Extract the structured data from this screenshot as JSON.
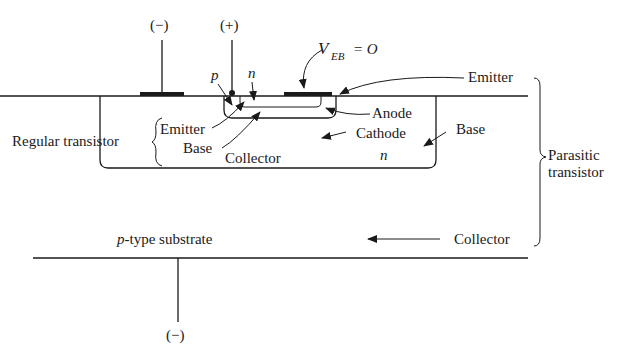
{
  "diagram": {
    "terminals": {
      "left_top": "(−)",
      "middle_top": "(+)",
      "bottom": "(−)"
    },
    "region_labels": {
      "p": "p",
      "n": "n",
      "veb_main": "V",
      "veb_sub": "EB",
      "veb_eq": "= O"
    },
    "regular_transistor": {
      "title": "Regular transistor",
      "emitter": "Emitter",
      "base": "Base",
      "collector": "Collector"
    },
    "inner_labels": {
      "anode": "Anode",
      "cathode": "Cathode",
      "n_well": "n"
    },
    "parasitic_transistor": {
      "title_line1": "Parasitic",
      "title_line2": "transistor",
      "emitter": "Emitter",
      "base": "Base",
      "collector": "Collector"
    },
    "substrate": {
      "label_italic": "p",
      "label_rest": "-type substrate"
    }
  }
}
